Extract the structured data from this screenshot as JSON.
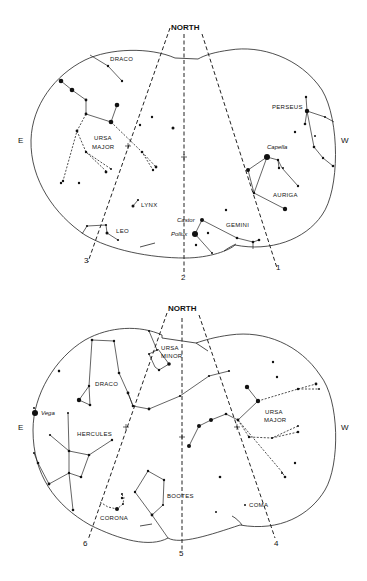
{
  "charts": [
    {
      "id": "top",
      "north_label": "NORTH",
      "east_label": "E",
      "west_label": "W",
      "meridians": [
        "3",
        "2",
        "1"
      ],
      "constellations": [
        "DRACO",
        "URSA",
        "MAJOR",
        "PERSEUS",
        "AURIGA",
        "LYNX",
        "LEO",
        "GEMINI"
      ],
      "stars": [
        "Capella",
        "Castor",
        "Pollux"
      ]
    },
    {
      "id": "bottom",
      "north_label": "NORTH",
      "east_label": "E",
      "west_label": "W",
      "meridians": [
        "6",
        "5",
        "4"
      ],
      "constellations": [
        "URSA",
        "MINOR",
        "DRACO",
        "HERCULES",
        "URSA",
        "MAJOR",
        "BOOTES",
        "CORONA",
        "COMA"
      ],
      "stars": [
        "Vega"
      ]
    }
  ]
}
